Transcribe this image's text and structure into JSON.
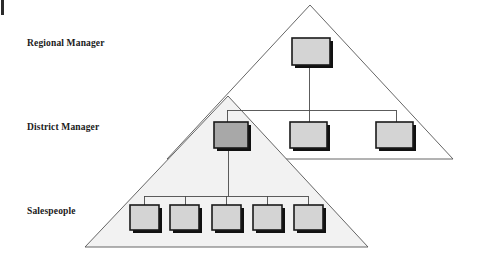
{
  "figure": {
    "type": "org-chart-pyramid-diagram",
    "background_color": "#ffffff",
    "labels": {
      "regional": "Regional Manager",
      "district": "District Manager",
      "salespeople": "Salespeople"
    },
    "colors": {
      "node_fill_light": "#d4d4d4",
      "node_fill_dark": "#a8a8a8",
      "node_border": "#1a1a1a",
      "node_shadow": "#111111",
      "triangle_stroke": "#555555",
      "triangle_fill_lower": "#f2f2f2",
      "triangle_fill_upper": "#ffffff",
      "connector": "#4a4a4a",
      "text": "#1a1a1a"
    },
    "triangles": [
      {
        "name": "regional-territory-triangle",
        "apex": [
          310,
          5
        ],
        "base_left": [
          167,
          159
        ],
        "base_right": [
          453,
          159
        ],
        "fill": "#ffffff"
      },
      {
        "name": "district-territory-triangle",
        "apex": [
          228,
          96
        ],
        "base_left": [
          85,
          247
        ],
        "base_right": [
          368,
          247
        ],
        "fill": "#f2f2f2"
      }
    ],
    "nodes": {
      "regional": [
        {
          "name": "regional-manager-node",
          "x": 292,
          "y": 38,
          "w": 38,
          "h": 27,
          "shade": "light"
        }
      ],
      "district": [
        {
          "name": "district-manager-node-1",
          "x": 214,
          "y": 122,
          "w": 34,
          "h": 26,
          "shade": "dark"
        },
        {
          "name": "district-manager-node-2",
          "x": 290,
          "y": 122,
          "w": 37,
          "h": 26,
          "shade": "light"
        },
        {
          "name": "district-manager-node-3",
          "x": 376,
          "y": 122,
          "w": 37,
          "h": 26,
          "shade": "light"
        }
      ],
      "salespeople": [
        {
          "name": "salesperson-node-1",
          "x": 130,
          "y": 205,
          "w": 29,
          "h": 25,
          "shade": "light"
        },
        {
          "name": "salesperson-node-2",
          "x": 170,
          "y": 205,
          "w": 29,
          "h": 25,
          "shade": "light"
        },
        {
          "name": "salesperson-node-3",
          "x": 212,
          "y": 205,
          "w": 29,
          "h": 25,
          "shade": "light"
        },
        {
          "name": "salesperson-node-4",
          "x": 253,
          "y": 205,
          "w": 29,
          "h": 25,
          "shade": "light"
        },
        {
          "name": "salesperson-node-5",
          "x": 294,
          "y": 205,
          "w": 29,
          "h": 25,
          "shade": "light"
        }
      ]
    },
    "connectors": {
      "regional_to_bus": {
        "x": 309,
        "y1": 65,
        "y2": 110
      },
      "district_bus": {
        "y": 110,
        "x1": 227,
        "x2": 396
      },
      "district_drops": [
        {
          "x": 227,
          "y1": 110,
          "y2": 122
        },
        {
          "x": 309,
          "y1": 110,
          "y2": 122
        },
        {
          "x": 396,
          "y1": 110,
          "y2": 122
        }
      ],
      "district1_to_bus": {
        "x": 228,
        "y1": 148,
        "y2": 196
      },
      "sales_bus": {
        "y": 196,
        "x1": 144,
        "x2": 308
      },
      "sales_drops": [
        {
          "x": 144,
          "y1": 196,
          "y2": 205
        },
        {
          "x": 185,
          "y1": 196,
          "y2": 205
        },
        {
          "x": 226,
          "y1": 196,
          "y2": 205
        },
        {
          "x": 267,
          "y1": 196,
          "y2": 205
        },
        {
          "x": 308,
          "y1": 196,
          "y2": 205
        }
      ]
    },
    "page_edge_mark": {
      "name": "page-edge-mark",
      "x": 1,
      "y": 0,
      "w": 3,
      "h": 15
    }
  }
}
